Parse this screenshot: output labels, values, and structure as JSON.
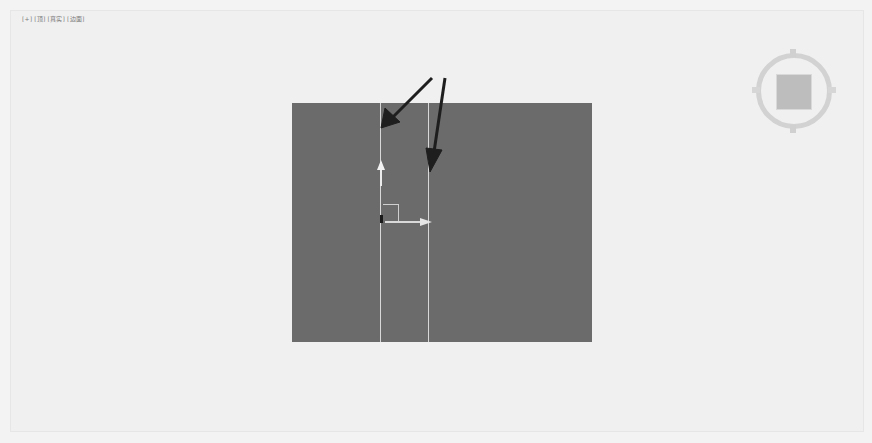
{
  "viewport": {
    "label": {
      "plus": "[+]",
      "view": "[顶]",
      "shading": "[真实]",
      "edges": "[边面]"
    },
    "plane": {
      "color": "#6b6b6b",
      "edge_color": "#d8d8d8",
      "selected_edges": 2
    },
    "viewcube": {
      "label": "ViewCube"
    },
    "annotations": {
      "arrow_color": "#1e1e1e",
      "arrow_count": 2
    }
  }
}
